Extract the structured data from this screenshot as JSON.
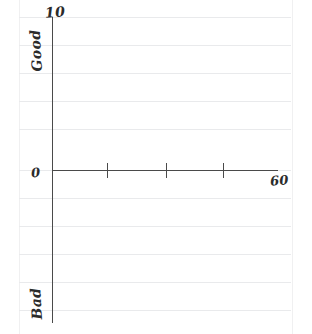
{
  "chart_data": {
    "type": "line",
    "title": "",
    "subtitle": "",
    "xlabel": "",
    "ylabel": "",
    "series": [],
    "x": [],
    "categories": [],
    "values": [],
    "grid": true,
    "legend": "none",
    "xlim": [
      0,
      60
    ],
    "ylim": [
      0,
      10
    ],
    "x_axis": {
      "min_label": "0",
      "max_label": "60",
      "tick_labels": [
        "0",
        "60"
      ],
      "tick_count": 3
    },
    "y_axis": {
      "max_label": "10",
      "top_text": "Good",
      "bottom_text": "Bad",
      "tick_labels": [
        "10"
      ]
    },
    "annotations": [
      {
        "text": "10",
        "role": "y-axis-max"
      },
      {
        "text": "Good",
        "role": "y-axis-high-end"
      },
      {
        "text": "Bad",
        "role": "y-axis-low-end"
      },
      {
        "text": "0",
        "role": "origin"
      },
      {
        "text": "60",
        "role": "x-axis-max"
      }
    ]
  },
  "axes": {
    "y_max": "10",
    "y_high_label": "Good",
    "y_low_label": "Bad",
    "origin": "0",
    "x_max": "60"
  },
  "grid": {
    "rule_positions": [
      17,
      45,
      73,
      101,
      129,
      170,
      198,
      226,
      254,
      282,
      310
    ],
    "color": "#e9eaec"
  },
  "ticks": {
    "x_positions": [
      107,
      166,
      223
    ]
  },
  "colors": {
    "background": "#ffffff",
    "axis": "#4a4a4a",
    "rule": "#e9eaec",
    "ink": "#2b2b2b"
  }
}
